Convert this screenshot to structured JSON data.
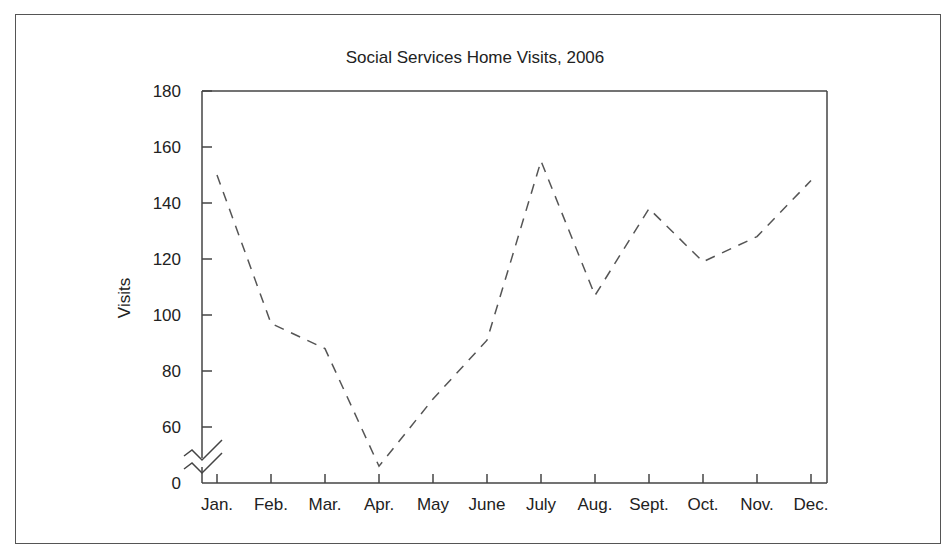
{
  "chart_data": {
    "type": "line",
    "title": "Social Services Home Visits, 2006",
    "xlabel": "",
    "ylabel": "Visits",
    "categories": [
      "Jan.",
      "Feb.",
      "Mar.",
      "Apr.",
      "May",
      "June",
      "July",
      "Aug.",
      "Sept.",
      "Oct.",
      "Nov.",
      "Dec."
    ],
    "series": [
      {
        "name": "Visits",
        "values": [
          150,
          97,
          88,
          46,
          70,
          91,
          155,
          107,
          138,
          119,
          128,
          148
        ],
        "style": "dashed"
      }
    ],
    "yticks": [
      0,
      60,
      80,
      100,
      120,
      140,
      160,
      180
    ],
    "ylim": [
      0,
      180
    ],
    "axis_break": "between 0 and 60",
    "grid": false,
    "legend": "none"
  }
}
